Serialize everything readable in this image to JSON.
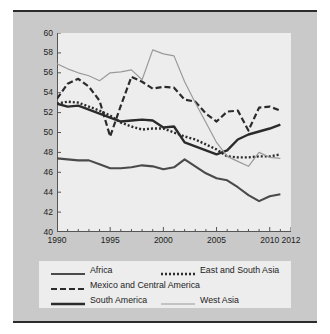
{
  "figure": {
    "background_color": "#c9c9c9",
    "plot_background_color": "#ededed",
    "rule_color": "#2b2b2b"
  },
  "legend": {
    "entries": [
      {
        "label": "Africa",
        "style": "solid-medium",
        "color": "#4a4a4a",
        "width": 2.1,
        "dash": "none"
      },
      {
        "label": "East and South Asia",
        "style": "dotted",
        "color": "#2b2b2b",
        "width": 2.4,
        "dash": "2,2"
      },
      {
        "label": "Mexico and Central America",
        "style": "dashed",
        "color": "#2b2b2b",
        "width": 2.2,
        "dash": "6,3"
      },
      {
        "label": "South America",
        "style": "solid-thick",
        "color": "#2b2b2b",
        "width": 2.4,
        "dash": "none"
      },
      {
        "label": "West Asia",
        "style": "solid-thin",
        "color": "#9a9a9a",
        "width": 1.2,
        "dash": "none"
      }
    ]
  },
  "chart_data": {
    "type": "line",
    "title": "",
    "subtitle": "",
    "xlabel": "",
    "ylabel": "",
    "xlim": [
      1990,
      2012
    ],
    "ylim": [
      40,
      60
    ],
    "yticks": [
      40,
      42,
      44,
      46,
      48,
      50,
      52,
      54,
      56,
      58,
      60
    ],
    "xticks": [
      1990,
      1995,
      2000,
      2005,
      2010,
      2012
    ],
    "xtick_labels": [
      "1990",
      "1995",
      "2000",
      "2005",
      "2010",
      "2012"
    ],
    "ytick_labels": [
      "40",
      "42",
      "44",
      "46",
      "48",
      "50",
      "52",
      "54",
      "56",
      "58",
      "60"
    ],
    "minor_xticks_every": 1,
    "grid": false,
    "legend_position": "below",
    "x": [
      1990,
      1991,
      1992,
      1993,
      1994,
      1995,
      1996,
      1997,
      1998,
      1999,
      2000,
      2001,
      2002,
      2003,
      2004,
      2005,
      2006,
      2007,
      2008,
      2009,
      2010,
      2011
    ],
    "series": [
      {
        "name": "Africa",
        "color": "#4a4a4a",
        "dash": "none",
        "width": 2.1,
        "values": [
          47.4,
          47.3,
          47.2,
          47.2,
          46.8,
          46.4,
          46.4,
          46.5,
          46.7,
          46.6,
          46.3,
          46.5,
          47.3,
          46.6,
          45.9,
          45.4,
          45.2,
          44.5,
          43.7,
          43.1,
          43.6,
          43.8
        ]
      },
      {
        "name": "East and South Asia",
        "color": "#2b2b2b",
        "dash": "2,2",
        "width": 2.4,
        "values": [
          52.9,
          53.1,
          53.0,
          52.6,
          52.2,
          51.7,
          51.0,
          50.6,
          50.3,
          50.4,
          50.4,
          50.0,
          49.6,
          49.3,
          48.8,
          48.3,
          47.6,
          47.5,
          47.5,
          47.6,
          47.6,
          47.8
        ]
      },
      {
        "name": "Mexico and Central America",
        "color": "#2b2b2b",
        "dash": "6,3",
        "width": 2.2,
        "values": [
          53.4,
          54.9,
          55.4,
          54.6,
          53.2,
          49.6,
          52.7,
          55.6,
          55.1,
          54.4,
          54.6,
          54.5,
          53.3,
          53.1,
          51.9,
          51.1,
          52.1,
          52.2,
          50.2,
          52.5,
          52.6,
          52.2
        ]
      },
      {
        "name": "South America",
        "color": "#2b2b2b",
        "dash": "none",
        "width": 2.4,
        "values": [
          52.9,
          52.6,
          52.7,
          52.3,
          51.9,
          51.5,
          51.1,
          51.2,
          51.3,
          51.2,
          50.5,
          50.6,
          49.0,
          48.6,
          48.2,
          47.8,
          48.2,
          49.3,
          49.8,
          50.1,
          50.4,
          50.8
        ]
      },
      {
        "name": "West Asia",
        "color": "#9a9a9a",
        "dash": "none",
        "width": 1.2,
        "values": [
          56.9,
          56.4,
          56.0,
          55.7,
          55.2,
          56.0,
          56.1,
          56.3,
          55.3,
          58.3,
          57.9,
          57.7,
          55.1,
          53.0,
          51.0,
          49.0,
          47.6,
          47.1,
          46.6,
          48.0,
          47.5,
          47.4
        ]
      }
    ]
  }
}
